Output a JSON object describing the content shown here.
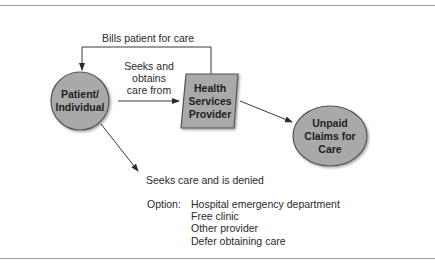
{
  "diagram": {
    "nodes": {
      "patient": {
        "label_line1": "Patient/",
        "label_line2": "Individual",
        "shape": "circle"
      },
      "provider": {
        "label_line1": "Health",
        "label_line2": "Services",
        "label_line3": "Provider",
        "shape": "parallelogram"
      },
      "unpaid": {
        "label_line1": "Unpaid",
        "label_line2": "Claims for",
        "label_line3": "Care",
        "shape": "ellipse"
      }
    },
    "edges": {
      "bills": {
        "label": "Bills patient for care",
        "from": "provider",
        "to": "patient"
      },
      "seeks_obtains": {
        "label_line1": "Seeks and",
        "label_line2": "obtains",
        "label_line3": "care from",
        "from": "patient",
        "to": "provider"
      },
      "to_unpaid": {
        "from": "provider",
        "to": "unpaid"
      },
      "denied": {
        "label": "Seeks care and is denied",
        "from": "patient"
      }
    },
    "options": {
      "label": "Option:",
      "items": [
        "Hospital emergency department",
        "Free clinic",
        "Other provider",
        "Defer obtaining care"
      ]
    },
    "colors": {
      "node_fill": "#a9a9a9",
      "node_stroke": "#555555",
      "line": "#3a3a3a",
      "rule": "#9a9a9a"
    }
  }
}
